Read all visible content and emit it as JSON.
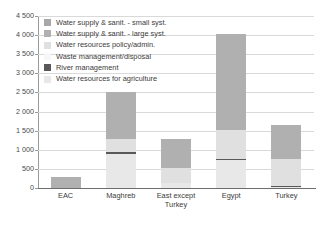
{
  "chart_data": {
    "type": "bar",
    "stacked": true,
    "title": "",
    "xlabel": "",
    "ylabel": "",
    "ylim": [
      0,
      4500
    ],
    "ytick_step": 500,
    "grid": true,
    "legend_position": "top-left-inside",
    "categories": [
      "EAC",
      "Maghreb",
      "East except Turkey",
      "Egypt",
      "Turkey"
    ],
    "category_labels": [
      [
        "EAC"
      ],
      [
        "Maghreb"
      ],
      [
        "East except",
        "Turkey"
      ],
      [
        "Egypt"
      ],
      [
        "Turkey"
      ]
    ],
    "ytick_labels": [
      "0",
      "500",
      "1 000",
      "1 500",
      "2 000",
      "2 500",
      "3 000",
      "3 500",
      "4 000",
      "4 500"
    ],
    "ytick_values": [
      0,
      500,
      1000,
      1500,
      2000,
      2500,
      3000,
      3500,
      4000,
      4500
    ],
    "series": [
      {
        "name": "Water resources for agriculture",
        "color": "#e8e8e8",
        "values": [
          0,
          880,
          120,
          720,
          20
        ]
      },
      {
        "name": "River management",
        "color": "#595959",
        "values": [
          0,
          70,
          0,
          45,
          25
        ]
      },
      {
        "name": "Waste management/disposal",
        "color": "#f3f3f3",
        "values": [
          0,
          0,
          0,
          0,
          0
        ]
      },
      {
        "name": "Water resources policy/admin.",
        "color": "#e0e0e0",
        "values": [
          0,
          320,
          400,
          760,
          710
        ]
      },
      {
        "name": "Water supply & sanit. - large syst.",
        "color": "#b0b0b0",
        "values": [
          300,
          1240,
          760,
          2505,
          895
        ]
      },
      {
        "name": "Water supply & sanit. - small syst.",
        "color": "#a8a8a8",
        "values": [
          0,
          0,
          0,
          0,
          0
        ]
      }
    ],
    "totals": [
      300,
      2510,
      1280,
      4030,
      1650
    ],
    "legend": [
      {
        "label": "Water supply & sanit. - small syst.",
        "color": "#a8a8a8"
      },
      {
        "label": "Water supply & sanit. - large syst.",
        "color": "#b0b0b0"
      },
      {
        "label": "Water resources policy/admin.",
        "color": "#e0e0e0"
      },
      {
        "label": "Waste management/disposal",
        "color": "#f7f7f7"
      },
      {
        "label": "River management",
        "color": "#595959"
      },
      {
        "label": "Water resources for agriculture",
        "color": "#e8e8e8"
      }
    ]
  }
}
